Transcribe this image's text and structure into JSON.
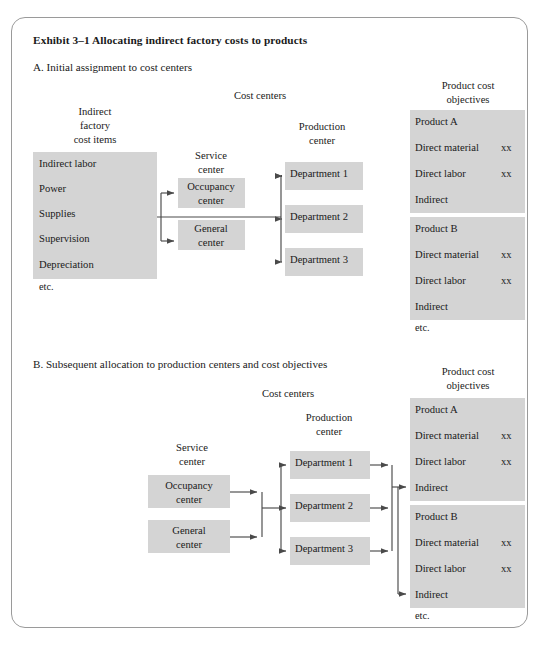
{
  "exhibit": {
    "title": "Exhibit 3–1 Allocating indirect factory costs to products"
  },
  "sections": {
    "a": {
      "heading": "A.  Initial assignment to cost centers",
      "headers": {
        "indirect_items": [
          "Indirect",
          "factory",
          "cost items"
        ],
        "cost_centers": "Cost centers",
        "service_center": [
          "Service",
          "center"
        ],
        "production_center": [
          "Production",
          "center"
        ],
        "product_objectives": [
          "Product cost",
          "objectives"
        ]
      },
      "indirect_items_box": [
        "Indirect labor",
        "Power",
        "Supplies",
        "Supervision",
        "Depreciation"
      ],
      "indirect_items_etc": "etc.",
      "service_centers": [
        {
          "line1": "Occupancy",
          "line2": "center"
        },
        {
          "line1": "General",
          "line2": "center"
        }
      ],
      "departments": [
        "Department 1",
        "Department 2",
        "Department 3"
      ],
      "products": [
        {
          "name": "Product A",
          "rows": [
            {
              "label": "Direct material",
              "value": "xx"
            },
            {
              "label": "Direct labor",
              "value": "xx"
            },
            {
              "label": "Indirect",
              "value": ""
            }
          ]
        },
        {
          "name": "Product B",
          "rows": [
            {
              "label": "Direct material",
              "value": "xx"
            },
            {
              "label": "Direct labor",
              "value": "xx"
            },
            {
              "label": "Indirect",
              "value": ""
            }
          ]
        }
      ],
      "products_etc": "etc."
    },
    "b": {
      "heading": "B.  Subsequent allocation to production centers and cost objectives",
      "headers": {
        "cost_centers": "Cost centers",
        "service_center": [
          "Service",
          "center"
        ],
        "production_center": [
          "Production",
          "center"
        ],
        "product_objectives": [
          "Product cost",
          "objectives"
        ]
      },
      "service_centers": [
        {
          "line1": "Occupancy",
          "line2": "center"
        },
        {
          "line1": "General",
          "line2": "center"
        }
      ],
      "departments": [
        "Department 1",
        "Department 2",
        "Department 3"
      ],
      "products": [
        {
          "name": "Product A",
          "rows": [
            {
              "label": "Direct material",
              "value": "xx"
            },
            {
              "label": "Direct labor",
              "value": "xx"
            },
            {
              "label": "Indirect",
              "value": ""
            }
          ]
        },
        {
          "name": "Product B",
          "rows": [
            {
              "label": "Direct material",
              "value": "xx"
            },
            {
              "label": "Direct labor",
              "value": "xx"
            },
            {
              "label": "Indirect",
              "value": ""
            }
          ]
        }
      ],
      "products_etc": "etc."
    }
  },
  "colors": {
    "box_fill": "#d4d4d4",
    "line": "#4a4a4a",
    "frame_border": "#9a9a9a",
    "text": "#1a1a1a",
    "background": "#ffffff"
  }
}
